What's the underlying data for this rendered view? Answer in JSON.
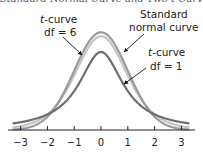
{
  "title": "Standard Normal Curve and Two t-Curves",
  "chart_data": {
    "type": "line",
    "title": "Standard Normal Curve and Two t-Curves",
    "xlabel": "",
    "ylabel": "",
    "xlim": [
      -3.3,
      3.3
    ],
    "x_ticks": [
      -3,
      -2,
      -1,
      0,
      1,
      2,
      3
    ],
    "x_tick_labels": [
      "−3",
      "−2",
      "−1",
      "0",
      "1",
      "2",
      "3"
    ],
    "grid": false,
    "series": [
      {
        "name": "Standard normal curve",
        "kind": "normal",
        "color": "#9a9a9a",
        "peak": 0.399
      },
      {
        "name": "t-curve df = 6",
        "kind": "t",
        "df": 6,
        "color": "#c4c4c4",
        "peak": 0.383
      },
      {
        "name": "t-curve df = 1",
        "kind": "t",
        "df": 1,
        "color": "#6e6e6e",
        "peak": 0.318
      }
    ],
    "annotations": [
      {
        "text_line1_italic": "t",
        "text_line1": "-curve",
        "text_line2": "df = 6",
        "points_to": "t-curve df = 6 (left side)"
      },
      {
        "text_line1": "Standard",
        "text_line2": "normal curve",
        "points_to": "Standard normal curve (right side)"
      },
      {
        "text_line1_italic": "t",
        "text_line1": "-curve",
        "text_line2": "df = 1",
        "points_to": "t-curve df = 1 (right side)"
      }
    ]
  },
  "labels": {
    "t6_italic": "t",
    "t6_rest": "-curve",
    "t6_df": "df = 6",
    "normal_l1": "Standard",
    "normal_l2": "normal curve",
    "t1_italic": "t",
    "t1_rest": "-curve",
    "t1_df": "df = 1"
  },
  "ticks": [
    "−3",
    "−2",
    "−1",
    "0",
    "1",
    "2",
    "3"
  ]
}
